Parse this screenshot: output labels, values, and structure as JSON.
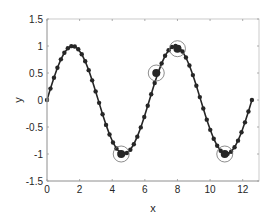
{
  "chart_data": {
    "type": "line",
    "title": "",
    "xlabel": "x",
    "ylabel": "y",
    "xlim": [
      0,
      13
    ],
    "ylim": [
      -1.5,
      1.5
    ],
    "xticks": [
      0,
      2,
      4,
      6,
      8,
      10,
      12
    ],
    "yticks": [
      -1.5,
      -1,
      -0.5,
      0,
      0.5,
      1,
      1.5
    ],
    "xtick_labels": [
      "0",
      "2",
      "4",
      "6",
      "8",
      "10",
      "12"
    ],
    "ytick_labels": [
      "-1.5",
      "-1",
      "-0.5",
      "0",
      "0.5",
      "1",
      "1.5"
    ],
    "grid": false,
    "series": [
      {
        "name": "sin(x)",
        "function": "sin",
        "x_start": 0,
        "x_end": 12.566,
        "num_points": 60,
        "color": "#262626",
        "marker": "filled-circle"
      }
    ],
    "highlighted_points": [
      {
        "x": 4.55,
        "y": -1.0
      },
      {
        "x": 6.7,
        "y": 0.5
      },
      {
        "x": 8.0,
        "y": 0.95
      },
      {
        "x": 10.9,
        "y": -1.0
      }
    ],
    "colors": {
      "line": "#262626",
      "axis": "#262626",
      "highlight_circle": "#707070"
    }
  }
}
